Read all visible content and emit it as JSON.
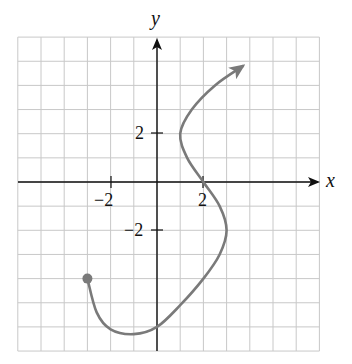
{
  "chart_data": {
    "type": "line",
    "title": "",
    "xlabel": "x",
    "ylabel": "y",
    "xlim": [
      -6,
      7
    ],
    "ylim": [
      -7,
      6
    ],
    "grid": true,
    "grid_step": 1,
    "x_ticks_labeled": [
      {
        "value": -2,
        "label": "−2"
      },
      {
        "value": 2,
        "label": "2"
      }
    ],
    "y_ticks_labeled": [
      {
        "value": 2,
        "label": "2"
      },
      {
        "value": -2,
        "label": "−2"
      }
    ],
    "series": [
      {
        "name": "curve",
        "color": "#7a7a7a",
        "start_marker": "closed-dot",
        "end_marker": "arrow",
        "points": [
          [
            -3,
            -4
          ],
          [
            -2.6,
            -5.4
          ],
          [
            -2,
            -6.1
          ],
          [
            -1,
            -6.3
          ],
          [
            0,
            -6
          ],
          [
            1,
            -5.1
          ],
          [
            2,
            -4
          ],
          [
            2.7,
            -3
          ],
          [
            3,
            -2
          ],
          [
            2.7,
            -1
          ],
          [
            2,
            0
          ],
          [
            1.3,
            1
          ],
          [
            1,
            2
          ],
          [
            1.5,
            3
          ],
          [
            2.5,
            4
          ],
          [
            3.7,
            4.8
          ]
        ]
      }
    ],
    "key_points": {
      "start": [
        -3,
        -4
      ],
      "minimum": [
        -1,
        -6.3
      ],
      "y_intercept": [
        0,
        -6
      ],
      "rightmost": [
        3,
        -2
      ],
      "x_intercept": [
        2,
        0
      ],
      "leftmost_upper": [
        1,
        2
      ]
    }
  },
  "labels": {
    "x_axis": "x",
    "y_axis": "y",
    "x_tick_neg2": "−2",
    "x_tick_2": "2",
    "y_tick_2": "2",
    "y_tick_neg2": "−2"
  },
  "colors": {
    "grid": "#c8c8c8",
    "axis": "#111111",
    "curve": "#7a7a7a"
  }
}
